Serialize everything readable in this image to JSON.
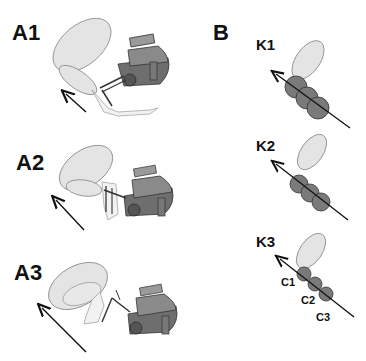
{
  "figure": {
    "panels": {
      "A": {
        "subpanels": [
          {
            "label": "A1"
          },
          {
            "label": "A2"
          },
          {
            "label": "A3"
          }
        ]
      },
      "B": {
        "label": "B",
        "subpanels": [
          {
            "label": "K1"
          },
          {
            "label": "K2"
          },
          {
            "label": "K3",
            "circle_labels": [
              "C1",
              "C2",
              "C3"
            ]
          }
        ]
      }
    },
    "colors": {
      "ellipse_fill": "#e4e4e4",
      "circle_fill": "#7a7a7a",
      "robot_dark": "#6e6e6e",
      "robot_light": "#9a9a9a",
      "line": "#111111"
    }
  }
}
